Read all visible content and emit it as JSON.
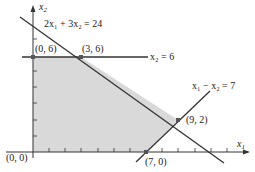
{
  "diagram": {
    "type": "linear-programming-feasible-region",
    "axes": {
      "x_label": "x",
      "x_sub": "1",
      "y_label": "x",
      "y_sub": "2"
    },
    "constraints": [
      {
        "id": "c1",
        "label": "2x₁ + 3x₂ = 24",
        "a": 2,
        "b": 3,
        "rhs": 24
      },
      {
        "id": "c2",
        "label": "x₂ = 6",
        "a": 0,
        "b": 1,
        "rhs": 6
      },
      {
        "id": "c3",
        "label": "x₁ − x₂ = 7",
        "a": 1,
        "b": -1,
        "rhs": 7
      }
    ],
    "vertices": [
      {
        "label": "(0, 0)",
        "x": 0,
        "y": 0
      },
      {
        "label": "(0, 6)",
        "x": 0,
        "y": 6
      },
      {
        "label": "(3, 6)",
        "x": 3,
        "y": 6
      },
      {
        "label": "(9, 2)",
        "x": 9,
        "y": 2
      },
      {
        "label": "(7, 0)",
        "x": 7,
        "y": 0
      }
    ],
    "colors": {
      "feasible_fill": "#d9d9d9",
      "line": "#333333",
      "vertex": "#555555"
    }
  }
}
